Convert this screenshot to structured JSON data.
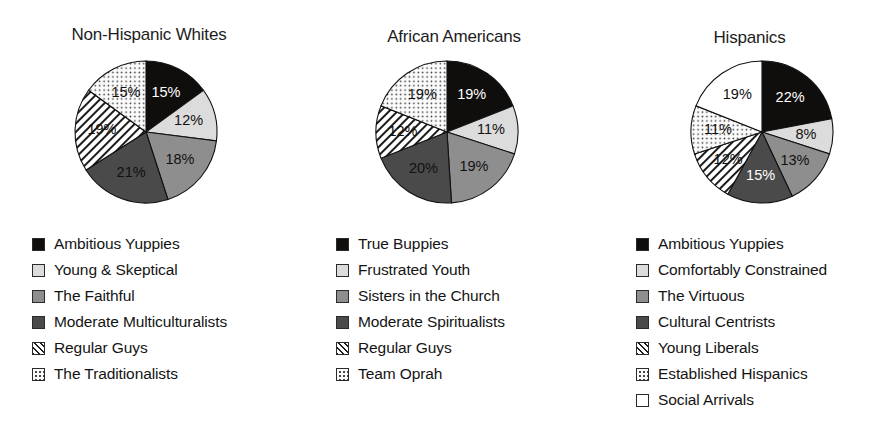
{
  "figure": {
    "background": "#ffffff",
    "panel_count": 3
  },
  "palette": {
    "black": "#100d0d",
    "light_gray": "#dcdcdc",
    "medium_gray": "#8e8e8e",
    "dark_gray": "#4a4a4a",
    "hatch": "#ffffff",
    "dots": "#fbfbfb",
    "white": "#ffffff",
    "outline": "#111111",
    "text": "#141414"
  },
  "charts": [
    {
      "id": "non-hispanic-whites",
      "title": "Non-Hispanic Whites",
      "type": "pie",
      "categories": [
        "Ambitious Yuppies",
        "Young & Skeptical",
        "The Faithful",
        "Moderate Multiculturalists",
        "Regular Guys",
        "The Traditionalists"
      ],
      "values": [
        15,
        12,
        18,
        21,
        19,
        15
      ],
      "labels": [
        "15%",
        "12%",
        "18%",
        "21%",
        "19%",
        "15%"
      ],
      "fills": [
        "black",
        "lightgray",
        "medgray",
        "darkgray",
        "hatch",
        "dots"
      ],
      "label_color": [
        "on-dark",
        "on-light",
        "on-light",
        "on-light",
        "on-light",
        "on-light"
      ]
    },
    {
      "id": "african-americans",
      "title": "African Americans",
      "type": "pie",
      "categories": [
        "True Buppies",
        "Frustrated Youth",
        "Sisters in the Church",
        "Moderate Spiritualists",
        "Regular Guys",
        "Team Oprah"
      ],
      "values": [
        19,
        11,
        19,
        20,
        12,
        19
      ],
      "labels": [
        "19%",
        "11%",
        "19%",
        "20%",
        "12%",
        "19%"
      ],
      "fills": [
        "black",
        "lightgray",
        "medgray",
        "darkgray",
        "hatch",
        "dots"
      ],
      "label_color": [
        "on-dark",
        "on-light",
        "on-light",
        "on-light",
        "on-light",
        "on-light"
      ]
    },
    {
      "id": "hispanics",
      "title": "Hispanics",
      "type": "pie",
      "categories": [
        "Ambitious Yuppies",
        "Comfortably Constrained",
        "The Virtuous",
        "Cultural Centrists",
        "Young Liberals",
        "Established Hispanics",
        "Social Arrivals"
      ],
      "values": [
        22,
        8,
        13,
        15,
        12,
        11,
        19
      ],
      "labels": [
        "22%",
        "8%",
        "13%",
        "15%",
        "12%",
        "11%",
        "19%"
      ],
      "fills": [
        "black",
        "lightgray",
        "medgray",
        "darkgray",
        "hatch",
        "dots",
        "white"
      ],
      "label_color": [
        "on-dark",
        "on-light",
        "on-light",
        "on-dark",
        "on-light",
        "on-light",
        "on-light"
      ]
    }
  ],
  "chart_data": {
    "type": "pie",
    "layout": "three side-by-side pie charts, each with a legend below",
    "legend_position": "below each pie",
    "units": "percent of group",
    "charts": [
      {
        "title": "Non-Hispanic Whites",
        "labels": [
          "Ambitious Yuppies",
          "Young & Skeptical",
          "The Faithful",
          "Moderate Multiculturalists",
          "Regular Guys",
          "The Traditionalists"
        ],
        "values": [
          15,
          12,
          18,
          21,
          19,
          15
        ],
        "total": 100
      },
      {
        "title": "African Americans",
        "labels": [
          "True Buppies",
          "Frustrated Youth",
          "Sisters in the Church",
          "Moderate Spiritualists",
          "Regular Guys",
          "Team Oprah"
        ],
        "values": [
          19,
          11,
          19,
          20,
          12,
          19
        ],
        "total": 100
      },
      {
        "title": "Hispanics",
        "labels": [
          "Ambitious Yuppies",
          "Comfortably Constrained",
          "The Virtuous",
          "Cultural Centrists",
          "Young Liberals",
          "Established Hispanics",
          "Social Arrivals"
        ],
        "values": [
          22,
          8,
          13,
          15,
          12,
          11,
          19
        ],
        "total": 100
      }
    ]
  }
}
